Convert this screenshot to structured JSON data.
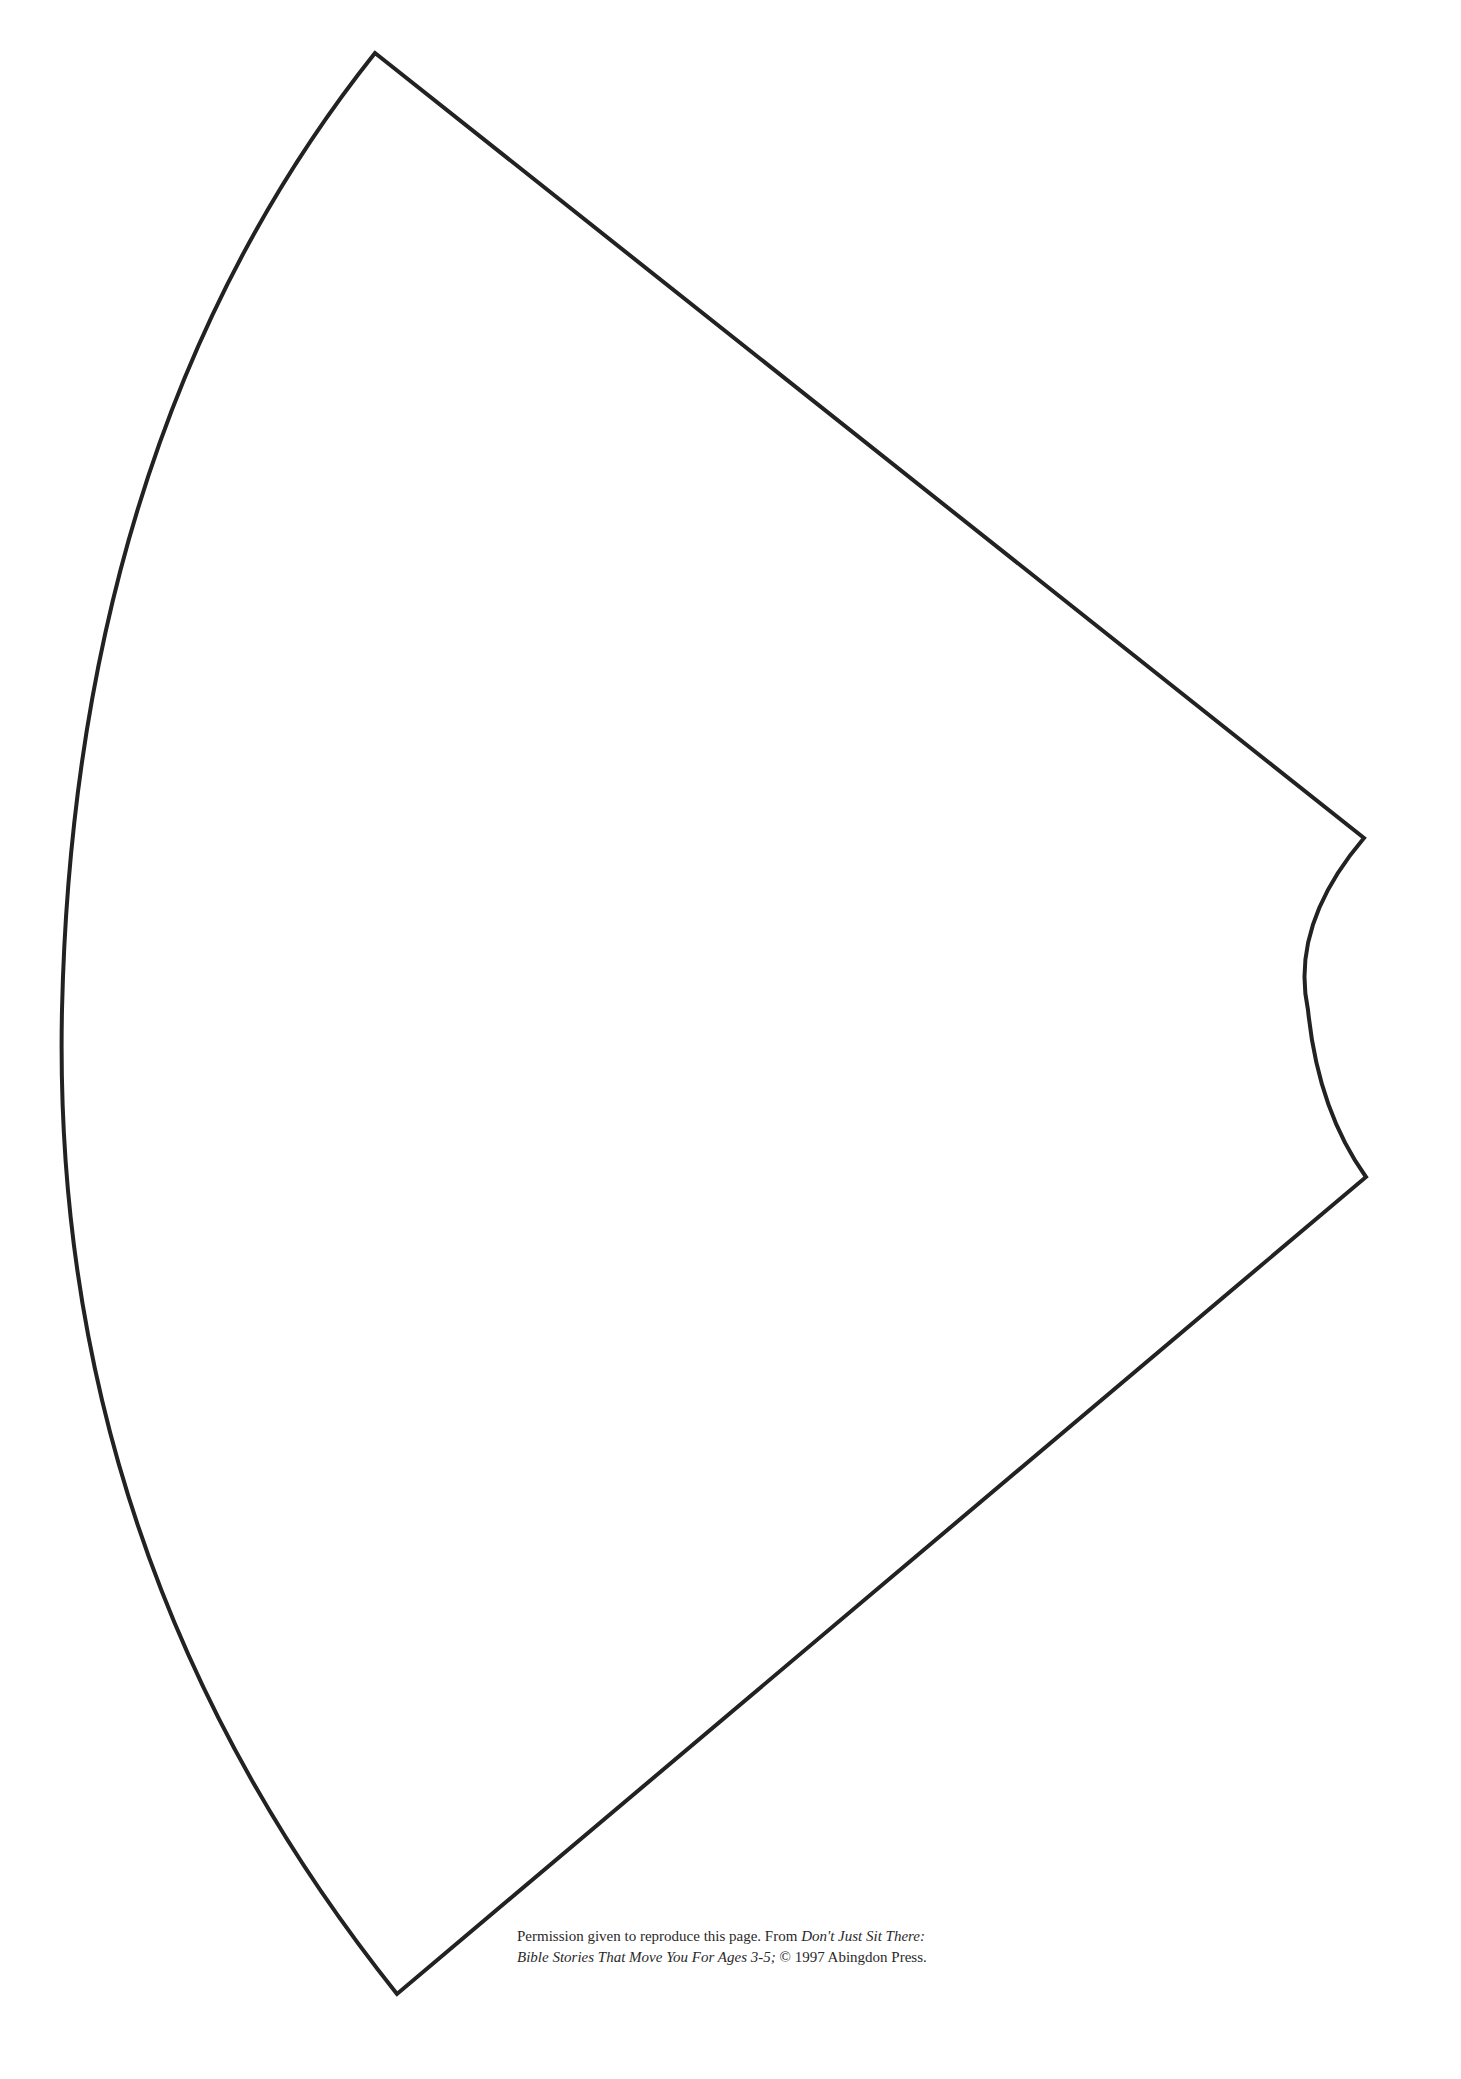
{
  "document": {
    "type": "printable cutout template",
    "shape": {
      "description": "cone / annular sector outline (party hat template)",
      "stroke_color": "#222222",
      "stroke_width": 4,
      "fill": "#ffffff",
      "vertices": {
        "top": [
          375,
          53
        ],
        "right_upper": [
          1364,
          838
        ],
        "right_lower": [
          1366,
          1177
        ],
        "bottom": [
          397,
          1994
        ]
      },
      "outer_arc_leftmost": [
        62,
        1010
      ],
      "inner_arc_leftmost": [
        1308,
        1010
      ]
    },
    "footer": {
      "line1_plain": "Permission given to reproduce this page. From ",
      "line1_italic": "Don't Just Sit There:",
      "line2_italic": "Bible Stories That Move You For Ages 3-5;",
      "line2_plain": " © 1997 Abingdon Press."
    }
  }
}
